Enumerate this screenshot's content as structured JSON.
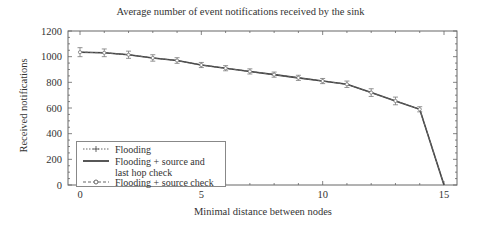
{
  "chart_data": {
    "type": "line",
    "title": "Average number of event notifications received by the sink",
    "xlabel": "Minimal distance between nodes",
    "ylabel": "Received notifications",
    "xlim": [
      -0.5,
      15.5
    ],
    "ylim": [
      0,
      1200
    ],
    "xticks": [
      0,
      5,
      10,
      15
    ],
    "yticks": [
      0,
      200,
      400,
      600,
      800,
      1000,
      1200
    ],
    "grid": false,
    "legend_position": "lower left",
    "x": [
      0,
      1,
      2,
      3,
      4,
      5,
      6,
      7,
      8,
      9,
      10,
      11,
      12,
      13,
      14,
      15
    ],
    "series": [
      {
        "name": "Flooding",
        "style": "dotted",
        "marker": "+",
        "values": [
          1035,
          1030,
          1015,
          990,
          970,
          935,
          910,
          885,
          860,
          835,
          810,
          785,
          720,
          655,
          590,
          0
        ]
      },
      {
        "name": "Flooding + source and last hop check",
        "style": "solid",
        "marker": "none",
        "values": [
          1035,
          1030,
          1015,
          990,
          970,
          935,
          910,
          885,
          860,
          835,
          810,
          785,
          720,
          655,
          590,
          0
        ]
      },
      {
        "name": "Flooding + source check",
        "style": "dashed",
        "marker": "o",
        "values": [
          1035,
          1030,
          1015,
          990,
          970,
          935,
          910,
          885,
          860,
          835,
          810,
          785,
          720,
          655,
          590,
          0
        ]
      }
    ],
    "error_bars": [
      35,
      30,
      28,
      25,
      22,
      20,
      20,
      20,
      20,
      20,
      20,
      25,
      30,
      30,
      20,
      0
    ]
  },
  "labels": {
    "title": "Average number of event notifications received by the sink",
    "xlabel": "Minimal distance between nodes",
    "ylabel": "Received notifications",
    "legend": [
      "Flooding",
      "Flooding + source and",
      "last hop check",
      "Flooding + source check"
    ]
  },
  "axis": {
    "yticklabels": [
      "0",
      "200",
      "400",
      "600",
      "800",
      "1000",
      "1200"
    ],
    "xticklabels": [
      "0",
      "5",
      "10",
      "15"
    ]
  }
}
